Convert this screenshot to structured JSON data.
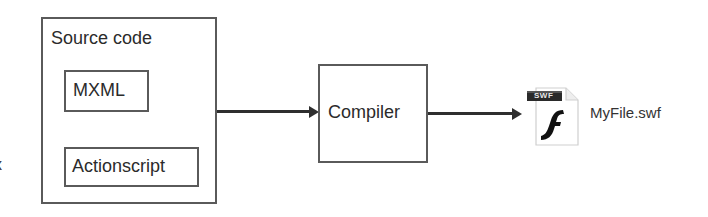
{
  "diagram": {
    "source_box": {
      "title": "Source code",
      "children": [
        {
          "label": "MXML"
        },
        {
          "label": "Actionscript"
        }
      ]
    },
    "compiler_box": {
      "label": "Compiler"
    },
    "output_file": {
      "icon": "swf-file-icon",
      "badge": "SWF",
      "glyph": "f",
      "label": "MyFile.swf"
    },
    "edges": [
      {
        "from": "Source code",
        "to": "Compiler"
      },
      {
        "from": "Compiler",
        "to": "MyFile.swf"
      }
    ],
    "cropped_edge_text": "x"
  },
  "colors": {
    "border": "#5a5a5a",
    "arrow": "#2e2e2e",
    "text": "#2b2b2b",
    "swf_banner": "#2a2a2a"
  }
}
